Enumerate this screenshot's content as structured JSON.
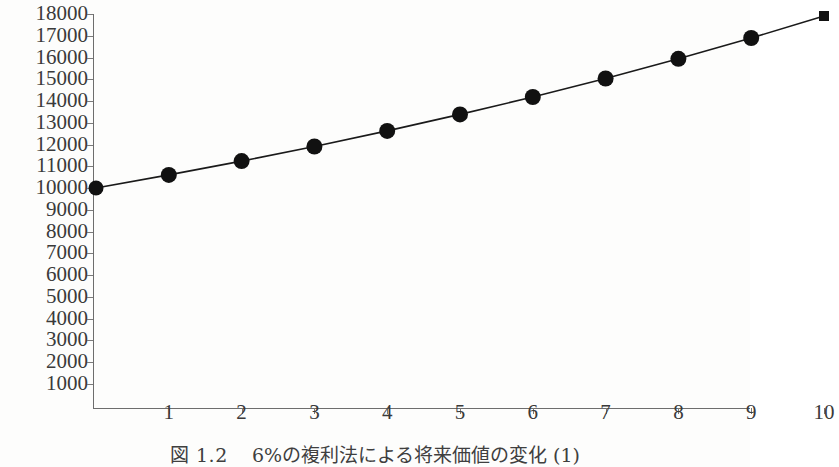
{
  "figure": {
    "caption_label": "図 1.2",
    "caption_text": "6%の複利法による将来価値の変化 (1)",
    "axis_color": "#6d6d6d",
    "marker_color": "#111111",
    "line_color": "#1a1a1a",
    "background": "#fdfdfc"
  },
  "chart_data": {
    "type": "line",
    "xlabel": "",
    "ylabel": "",
    "x": [
      0,
      1,
      2,
      3,
      4,
      5,
      6,
      7,
      8,
      9,
      10
    ],
    "values": [
      10000,
      10600,
      11236,
      11910,
      12625,
      13382,
      14185,
      15036,
      15938,
      16895,
      17908
    ],
    "series": [
      {
        "name": "将来価値",
        "x": [
          0,
          1,
          2,
          3,
          4,
          5,
          6,
          7,
          8,
          9,
          10
        ],
        "values": [
          10000,
          10600,
          11236,
          11910,
          12625,
          13382,
          14185,
          15036,
          15938,
          16895,
          17908
        ]
      }
    ],
    "xtick_labels": [
      "1",
      "2",
      "3",
      "4",
      "5",
      "6",
      "7",
      "8",
      "9",
      "10"
    ],
    "xtick_values": [
      1,
      2,
      3,
      4,
      5,
      6,
      7,
      8,
      9,
      10
    ],
    "ytick_labels": [
      "18000",
      "17000",
      "16000",
      "15000",
      "14000",
      "13000",
      "12000",
      "11000",
      "10000",
      "9000",
      "8000",
      "7000",
      "6000",
      "5000",
      "4000",
      "3000",
      "2000",
      "1000"
    ],
    "ytick_values": [
      18000,
      17000,
      16000,
      15000,
      14000,
      13000,
      12000,
      11000,
      10000,
      9000,
      8000,
      7000,
      6000,
      5000,
      4000,
      3000,
      2000,
      1000
    ],
    "xlim": [
      0,
      10.2
    ],
    "ylim": [
      0,
      18250
    ],
    "grid": false,
    "legend": false,
    "marker": "circle",
    "annotation": "元本 10000 を年利 6% の複利で 10 年間運用した将来価値"
  }
}
